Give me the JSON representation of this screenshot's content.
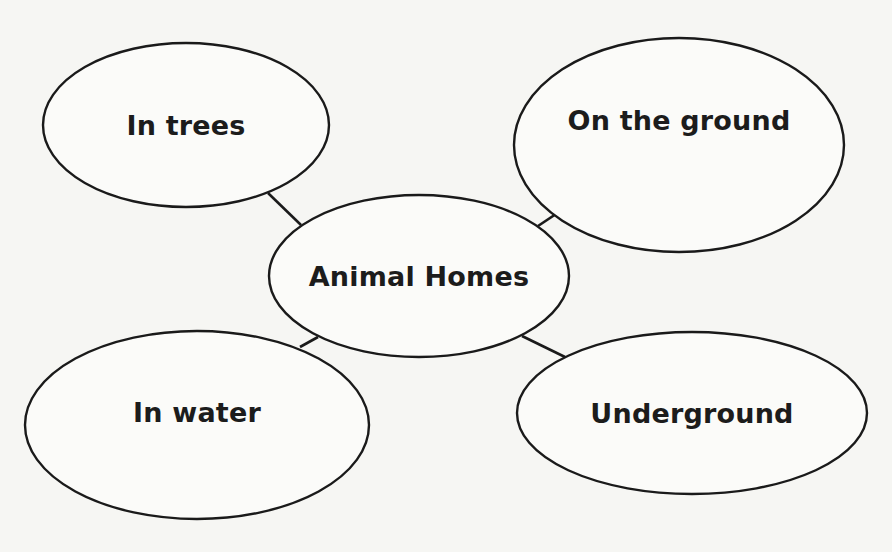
{
  "diagram": {
    "type": "concept-web",
    "center": {
      "label": "Animal Homes",
      "cx": 419,
      "cy": 276,
      "rx": 150,
      "ry": 81
    },
    "branches": [
      {
        "id": "in-trees",
        "label": "In trees",
        "cx": 186,
        "cy": 125,
        "rx": 143,
        "ry": 82,
        "label_y": 125,
        "connector": {
          "x1": 268,
          "y1": 193,
          "x2": 301,
          "y2": 225
        }
      },
      {
        "id": "on-the-ground",
        "label": "On the ground",
        "cx": 679,
        "cy": 145,
        "rx": 165,
        "ry": 107,
        "label_y": 120,
        "connector": {
          "x1": 538,
          "y1": 226,
          "x2": 556,
          "y2": 214
        }
      },
      {
        "id": "in-water",
        "label": "In water",
        "cx": 197,
        "cy": 425,
        "rx": 172,
        "ry": 94,
        "label_y": 412,
        "connector": {
          "x1": 300,
          "y1": 347,
          "x2": 318,
          "y2": 337
        }
      },
      {
        "id": "underground",
        "label": "Underground",
        "cx": 692,
        "cy": 413,
        "rx": 175,
        "ry": 81,
        "label_y": 413,
        "connector": {
          "x1": 522,
          "y1": 336,
          "x2": 565,
          "y2": 357
        }
      }
    ],
    "colors": {
      "stroke": "#1a1a1a",
      "text": "#1c1c1c",
      "background": "#f6f6f3"
    }
  }
}
